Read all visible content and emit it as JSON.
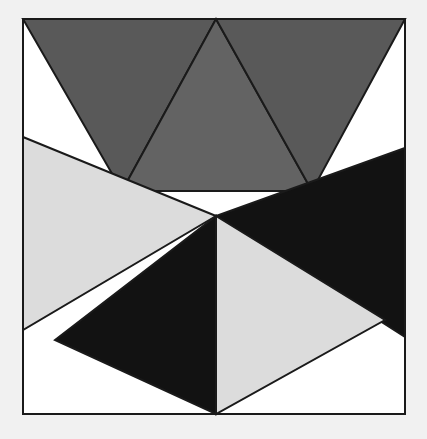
{
  "artwork": {
    "title": "Geometric Triangle Composition",
    "canvas": {
      "width": 427,
      "height": 439
    },
    "background_color": "#f1f1f1",
    "frame": {
      "label": "Artwork Frame",
      "x": 23,
      "y": 19,
      "width": 382,
      "height": 395,
      "fill_color": "#ffffff",
      "stroke_color": "#1a1a1a",
      "stroke_width": 2
    },
    "palette": {
      "dark_gray": "#595959",
      "medium_gray": "#636363",
      "light_gray": "#dcdcdc",
      "black": "#121212",
      "white": "#ffffff",
      "outline": "#1a1a1a"
    },
    "shapes": [
      {
        "name": "upper-left-dark-gray-triangle",
        "fill": "#595959",
        "stroke": "#1a1a1a",
        "stroke_width": 2,
        "points": "23,19 216,19 122,191"
      },
      {
        "name": "upper-center-medium-gray-triangle",
        "fill": "#636363",
        "stroke": "#1a1a1a",
        "stroke_width": 2,
        "points": "216,19 312,191 122,191"
      },
      {
        "name": "upper-right-dark-gray-triangle",
        "fill": "#595959",
        "stroke": "#1a1a1a",
        "stroke_width": 2,
        "points": "216,19 405,19 312,191"
      },
      {
        "name": "left-light-gray-triangle",
        "fill": "#dcdcdc",
        "stroke": "#1a1a1a",
        "stroke_width": 2,
        "points": "23,137 216,216 23,330"
      },
      {
        "name": "right-black-triangle",
        "fill": "#121212",
        "stroke": "#1a1a1a",
        "stroke_width": 2,
        "points": "405,148 405,337 216,216"
      },
      {
        "name": "lower-left-black-triangle",
        "fill": "#121212",
        "stroke": "#1a1a1a",
        "stroke_width": 2,
        "points": "216,216 216,414 55,340"
      },
      {
        "name": "lower-right-light-gray-triangle",
        "fill": "#dcdcdc",
        "stroke": "#1a1a1a",
        "stroke_width": 2,
        "points": "216,216 385,320 216,414"
      }
    ]
  }
}
